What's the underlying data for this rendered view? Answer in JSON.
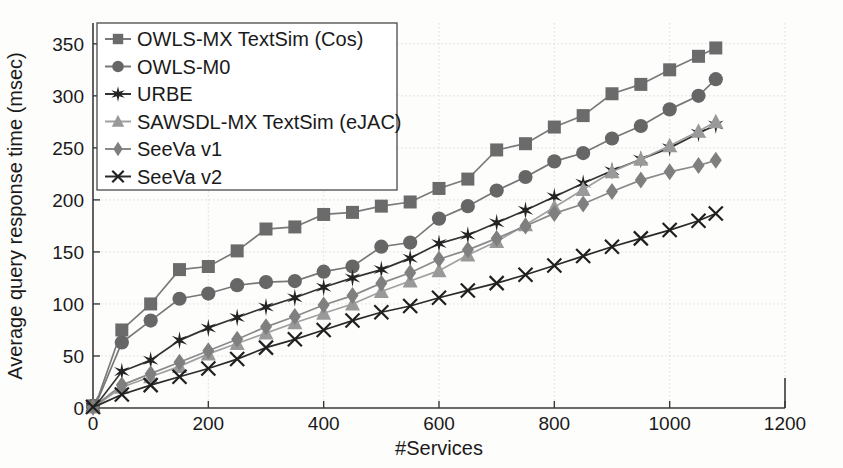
{
  "chart_data": {
    "type": "line",
    "title": "",
    "xlabel": "#Services",
    "ylabel": "Average query response time (msec)",
    "xlim": [
      0,
      1200
    ],
    "ylim": [
      0,
      370
    ],
    "xticks": [
      0,
      200,
      400,
      600,
      800,
      1000,
      1200
    ],
    "yticks": [
      0,
      50,
      100,
      150,
      200,
      250,
      300,
      350
    ],
    "xtick_labels": [
      "0",
      "200",
      "400",
      "600",
      "800",
      "1000",
      "1200"
    ],
    "ytick_labels": [
      "0",
      "50",
      "100",
      "150",
      "200",
      "250",
      "300",
      "350"
    ],
    "grid": true,
    "legend_position": "upper-left",
    "x": [
      0,
      10,
      50,
      100,
      150,
      200,
      250,
      300,
      350,
      400,
      450,
      500,
      550,
      600,
      650,
      700,
      750,
      800,
      850,
      900,
      950,
      1000,
      1050,
      1080
    ],
    "series": [
      {
        "name": "OWLS-MX TextSim (Cos)",
        "marker": "square",
        "color": "#6b6b6b",
        "line_color": "#7a7a7a",
        "values": [
          2,
          12,
          75,
          100,
          133,
          136,
          151,
          172,
          174,
          186,
          188,
          194,
          198,
          211,
          220,
          248,
          254,
          270,
          281,
          302,
          311,
          325,
          338,
          346
        ]
      },
      {
        "name": "OWLS-M0",
        "marker": "circle",
        "color": "#666666",
        "line_color": "#777777",
        "values": [
          2,
          10,
          63,
          84,
          105,
          110,
          118,
          121,
          122,
          131,
          136,
          155,
          159,
          182,
          194,
          209,
          222,
          237,
          245,
          259,
          271,
          287,
          300,
          316
        ]
      },
      {
        "name": "URBE",
        "marker": "star",
        "color": "#232323",
        "line_color": "#333333",
        "values": [
          1,
          6,
          35,
          46,
          65,
          77,
          87,
          97,
          106,
          116,
          125,
          133,
          144,
          158,
          166,
          178,
          190,
          203,
          216,
          228,
          239,
          250,
          264,
          272
        ]
      },
      {
        "name": "SAWSDL-MX TextSim (eJAC)",
        "marker": "triangle",
        "color": "#999999",
        "line_color": "#a0a0a0",
        "values": [
          1,
          4,
          20,
          30,
          40,
          52,
          62,
          72,
          82,
          91,
          100,
          112,
          122,
          132,
          147,
          160,
          176,
          193,
          210,
          227,
          239,
          252,
          266,
          275
        ]
      },
      {
        "name": "SeeVa v1",
        "marker": "diamond",
        "color": "#7f7f7f",
        "line_color": "#8a8a8a",
        "values": [
          1,
          5,
          22,
          33,
          44,
          55,
          66,
          78,
          88,
          99,
          108,
          120,
          130,
          143,
          152,
          163,
          175,
          187,
          196,
          208,
          219,
          227,
          233,
          238
        ]
      },
      {
        "name": "SeeVa v2",
        "marker": "cross",
        "color": "#1f1f1f",
        "line_color": "#2a2a2a",
        "values": [
          1,
          3,
          13,
          22,
          30,
          38,
          47,
          58,
          66,
          75,
          84,
          92,
          98,
          106,
          113,
          120,
          128,
          137,
          146,
          155,
          163,
          171,
          180,
          187
        ]
      }
    ]
  },
  "legend": {
    "items": [
      {
        "label": "OWLS-MX TextSim (Cos)",
        "marker": "square-marker"
      },
      {
        "label": "OWLS-M0",
        "marker": "circle-marker"
      },
      {
        "label": "URBE",
        "marker": "star-marker"
      },
      {
        "label": "SAWSDL-MX TextSim (eJAC)",
        "marker": "triangle-marker"
      },
      {
        "label": "SeeVa v1",
        "marker": "diamond-marker"
      },
      {
        "label": "SeeVa v2",
        "marker": "cross-marker"
      }
    ]
  }
}
